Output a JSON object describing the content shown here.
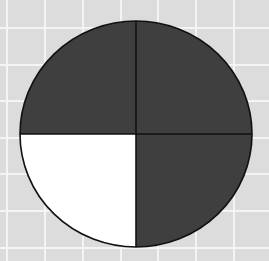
{
  "figure": {
    "total_parts": 4,
    "shaded_parts": 3,
    "unshaded_parts": 1,
    "quadrants": [
      {
        "position": "top-left",
        "shaded": true
      },
      {
        "position": "top-right",
        "shaded": true
      },
      {
        "position": "bottom-right",
        "shaded": true
      },
      {
        "position": "bottom-left",
        "shaded": false
      }
    ]
  },
  "colors": {
    "background": "#dcdcdc",
    "grid_line": "#f4f4f4",
    "shaded": "#3f3f3f",
    "unshaded": "#ffffff",
    "outline": "#111111"
  }
}
